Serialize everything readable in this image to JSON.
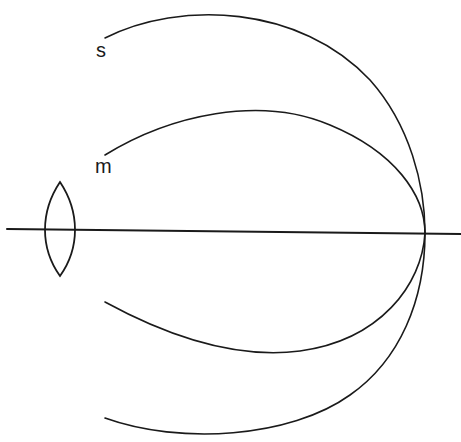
{
  "diagram": {
    "labels": {
      "sagittal": "s",
      "meridional": "m"
    },
    "elements": {
      "optical_axis": {
        "from": [
          7,
          229
        ],
        "to": [
          461,
          234
        ]
      },
      "lens": {
        "type": "biconvex",
        "top_tip": [
          60,
          182
        ],
        "bottom_tip": [
          60,
          276
        ],
        "center": [
          60,
          231
        ]
      },
      "focal_point": [
        425,
        233
      ],
      "curves": [
        {
          "name": "sagittal-surface",
          "label": "s",
          "upper_start": [
            105,
            38
          ],
          "lower_end": [
            105,
            418
          ]
        },
        {
          "name": "meridional-surface",
          "label": "m",
          "upper_start": [
            105,
            155
          ],
          "lower_end": [
            105,
            302
          ]
        }
      ]
    },
    "colors": {
      "line": "#1a1a1a",
      "background": "#ffffff"
    }
  }
}
